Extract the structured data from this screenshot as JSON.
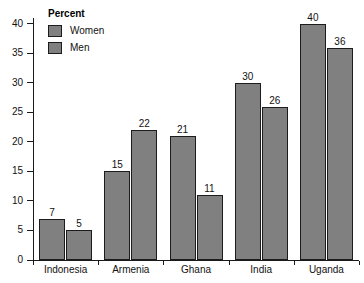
{
  "chart_data": {
    "type": "bar",
    "title": "",
    "xlabel": "",
    "ylabel": "Percent",
    "ylim": [
      0,
      41
    ],
    "yticks": [
      0,
      5,
      10,
      15,
      20,
      25,
      30,
      35,
      40
    ],
    "grid": false,
    "legend_position": "top-left",
    "categories": [
      "Indonesia",
      "Armenia",
      "Ghana",
      "India",
      "Uganda"
    ],
    "series": [
      {
        "name": "Women",
        "values": [
          7,
          15,
          21,
          30,
          40
        ],
        "color": "#808080"
      },
      {
        "name": "Men",
        "values": [
          5,
          22,
          11,
          26,
          36
        ],
        "color": "#808080"
      }
    ]
  },
  "legend": {
    "title": "Percent",
    "entries": [
      {
        "label": "Women"
      },
      {
        "label": "Men"
      }
    ]
  },
  "axis": {
    "y_tick_labels": [
      "40",
      "35",
      "30",
      "25",
      "20",
      "15",
      "10",
      "5",
      "0"
    ],
    "x_tick_labels": [
      "Indonesia",
      "Armenia",
      "Ghana",
      "India",
      "Uganda"
    ]
  },
  "bar_values": {
    "indonesia_women": "7",
    "indonesia_men": "5",
    "armenia_women": "15",
    "armenia_men": "22",
    "ghana_women": "21",
    "ghana_men": "11",
    "india_women": "30",
    "india_men": "26",
    "uganda_women": "40",
    "uganda_men": "36"
  },
  "colors": {
    "bar_fill": "#808080",
    "bar_stroke": "#1c1c1c",
    "axis": "#1a1a1a",
    "text": "#111111",
    "background": "#ffffff"
  }
}
